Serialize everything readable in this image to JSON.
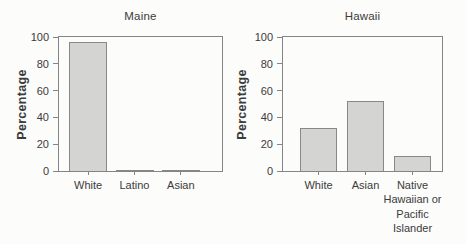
{
  "figure": {
    "background_color": "#fcfcfa",
    "text_color": "#3b3b3b",
    "axis_color": "#858585"
  },
  "chart_data": [
    {
      "type": "bar",
      "title": "Maine",
      "xlabel": "",
      "ylabel": "Percentage",
      "categories": [
        "White",
        "Latino",
        "Asian"
      ],
      "values": [
        96,
        1,
        1
      ],
      "ylim": [
        0,
        100
      ],
      "yticks": [
        0,
        20,
        40,
        60,
        80,
        100
      ],
      "grid": false,
      "legend": "none",
      "frame": "full-box",
      "bar_fill": "#d4d4d2",
      "bar_border": "#888886",
      "pad_left_px": 6,
      "pad_right_px": 18,
      "bar_width_px": 38
    },
    {
      "type": "bar",
      "title": "Hawaii",
      "xlabel": "",
      "ylabel": "Percentage",
      "categories": [
        "White",
        "Asian",
        "Native Hawaiian or Pacific Islander"
      ],
      "values": [
        32,
        52,
        11
      ],
      "ylim": [
        0,
        100
      ],
      "yticks": [
        0,
        20,
        40,
        60,
        80,
        100
      ],
      "grid": false,
      "legend": "none",
      "frame": "full-box",
      "bar_fill": "#d4d4d2",
      "bar_border": "#888886",
      "pad_left_px": 12,
      "pad_right_px": 6,
      "bar_width_px": 37
    }
  ]
}
